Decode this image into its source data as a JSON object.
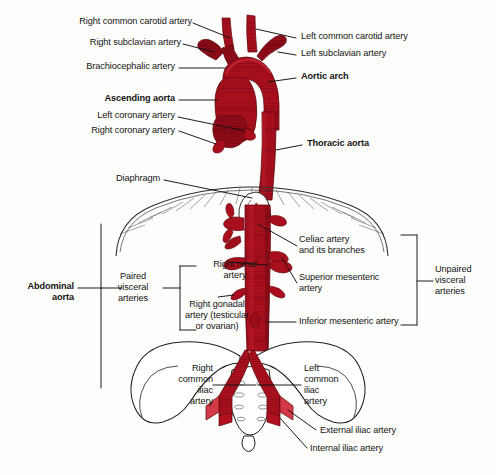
{
  "figure": {
    "background_color": "#fdfdfb",
    "artery_color": "#b3101f",
    "artery_dark": "#7d0a16",
    "line_color": "#111111",
    "bone_color": "#ffffff",
    "bone_stroke": "#222222"
  },
  "labels": {
    "right_common_carotid": "Right common carotid artery",
    "right_subclavian": "Right subclavian artery",
    "brachiocephalic": "Brachiocephalic artery",
    "ascending_aorta": "Ascending aorta",
    "left_coronary": "Left coronary artery",
    "right_coronary": "Right coronary artery",
    "left_common_carotid": "Left common carotid artery",
    "left_subclavian": "Left subclavian artery",
    "aortic_arch": "Aortic arch",
    "thoracic_aorta": "Thoracic aorta",
    "diaphragm": "Diaphragm",
    "abdominal_aorta": "Abdominal\naorta",
    "paired_visceral": "Paired\nvisceral\narteries",
    "right_renal": "Right renal\nartery",
    "right_gonadal": "Right gonadal\nartery (testicular\nor ovarian)",
    "celiac": "Celiac artery\nand its branches",
    "superior_mesenteric": "Superior mesenteric\nartery",
    "inferior_mesenteric": "Inferior mesenteric artery",
    "unpaired_visceral": "Unpaired\nvisceral\narteries",
    "right_common_iliac": "Right\ncommon\niliac\nartery",
    "left_common_iliac": "Left\ncommon\niliac\nartery",
    "external_iliac": "External iliac artery",
    "internal_iliac": "Internal iliac artery"
  },
  "bold_labels": [
    "ascending_aorta",
    "aortic_arch",
    "thoracic_aorta",
    "abdominal_aorta"
  ]
}
